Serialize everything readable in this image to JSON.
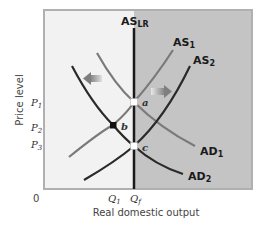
{
  "diagram": {
    "type": "AD-AS model",
    "y_axis_label": "Price level",
    "x_axis_label": "Real domestic output",
    "origin_label": "0",
    "price_ticks": [
      {
        "main": "P",
        "sub": "1"
      },
      {
        "main": "P",
        "sub": "2"
      },
      {
        "main": "P",
        "sub": "3"
      }
    ],
    "quantity_ticks": [
      {
        "main": "Q",
        "sub": "1"
      },
      {
        "main": "Q",
        "sub": "f"
      }
    ],
    "curves": {
      "as_lr": {
        "main": "AS",
        "sub": "LR"
      },
      "as1": {
        "main": "AS",
        "sub": "1"
      },
      "as2": {
        "main": "AS",
        "sub": "2"
      },
      "ad1": {
        "main": "AD",
        "sub": "1"
      },
      "ad2": {
        "main": "AD",
        "sub": "2"
      }
    },
    "points": {
      "a": "a",
      "b": "b",
      "c": "c"
    },
    "colors": {
      "left_region": "#f2f2f2",
      "right_region": "#c4c4c4",
      "frame": "#b0b0b0",
      "dark_curve": "#2a2a2a",
      "light_curve": "#7a7a7a",
      "arrow": "#888888"
    }
  }
}
